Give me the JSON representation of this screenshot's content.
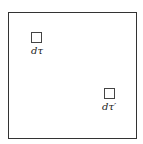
{
  "diagram": {
    "colors": {
      "line": "#333333",
      "background": "#ffffff"
    },
    "elements": [
      {
        "id": "element-1",
        "label": "dτ"
      },
      {
        "id": "element-2",
        "label": "dτ′"
      }
    ]
  }
}
